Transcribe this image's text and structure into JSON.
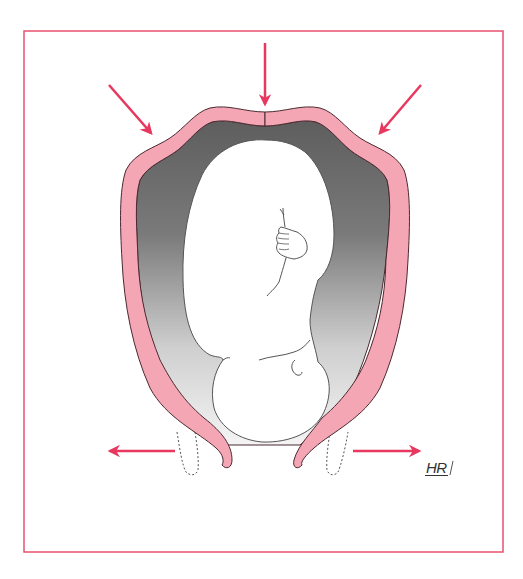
{
  "figure": {
    "signature": "HR",
    "colors": {
      "frame": "#e8506e",
      "arrow": "#e8385f",
      "uterine_wall": "#f4a6b4",
      "wall_outline": "#4a2a30",
      "cavity_dark": "#6b6b6b",
      "cavity_light": "#f2f2f2",
      "fetus_fill": "#ffffff",
      "fetus_outline": "#555555"
    },
    "arrows": [
      {
        "name": "fundal-arrow-top",
        "direction": "down"
      },
      {
        "name": "fundal-arrow-left",
        "direction": "down-right"
      },
      {
        "name": "fundal-arrow-right",
        "direction": "down-left"
      },
      {
        "name": "cervix-arrow-left",
        "direction": "left"
      },
      {
        "name": "cervix-arrow-right",
        "direction": "right"
      }
    ]
  }
}
